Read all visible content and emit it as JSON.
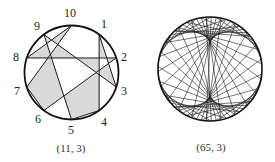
{
  "figures": [
    {
      "id": "left",
      "caption": "(11, 3)",
      "modulus": 11,
      "multiplier": 3,
      "center": [
        71.5,
        72.5
      ],
      "radius": 47,
      "point_labels": [
        "1",
        "2",
        "3",
        "4",
        "5",
        "6",
        "7",
        "8",
        "9",
        "10"
      ],
      "shaded": true,
      "fill_color": "#d9d9d9",
      "line_color": "#1a1a1a"
    },
    {
      "id": "right",
      "caption": "(65, 3)",
      "modulus": 65,
      "multiplier": 3,
      "center": [
        72,
        69
      ],
      "radius": 52,
      "point_labels": [],
      "shaded": false,
      "line_color": "#1a1a1a"
    }
  ],
  "captions": {
    "left": "(11, 3)",
    "right": "(65, 3)"
  },
  "labels": {
    "p1": "1",
    "p2": "2",
    "p3": "3",
    "p4": "4",
    "p5": "5",
    "p6": "6",
    "p7": "7",
    "p8": "8",
    "p9": "9",
    "p10": "10"
  }
}
